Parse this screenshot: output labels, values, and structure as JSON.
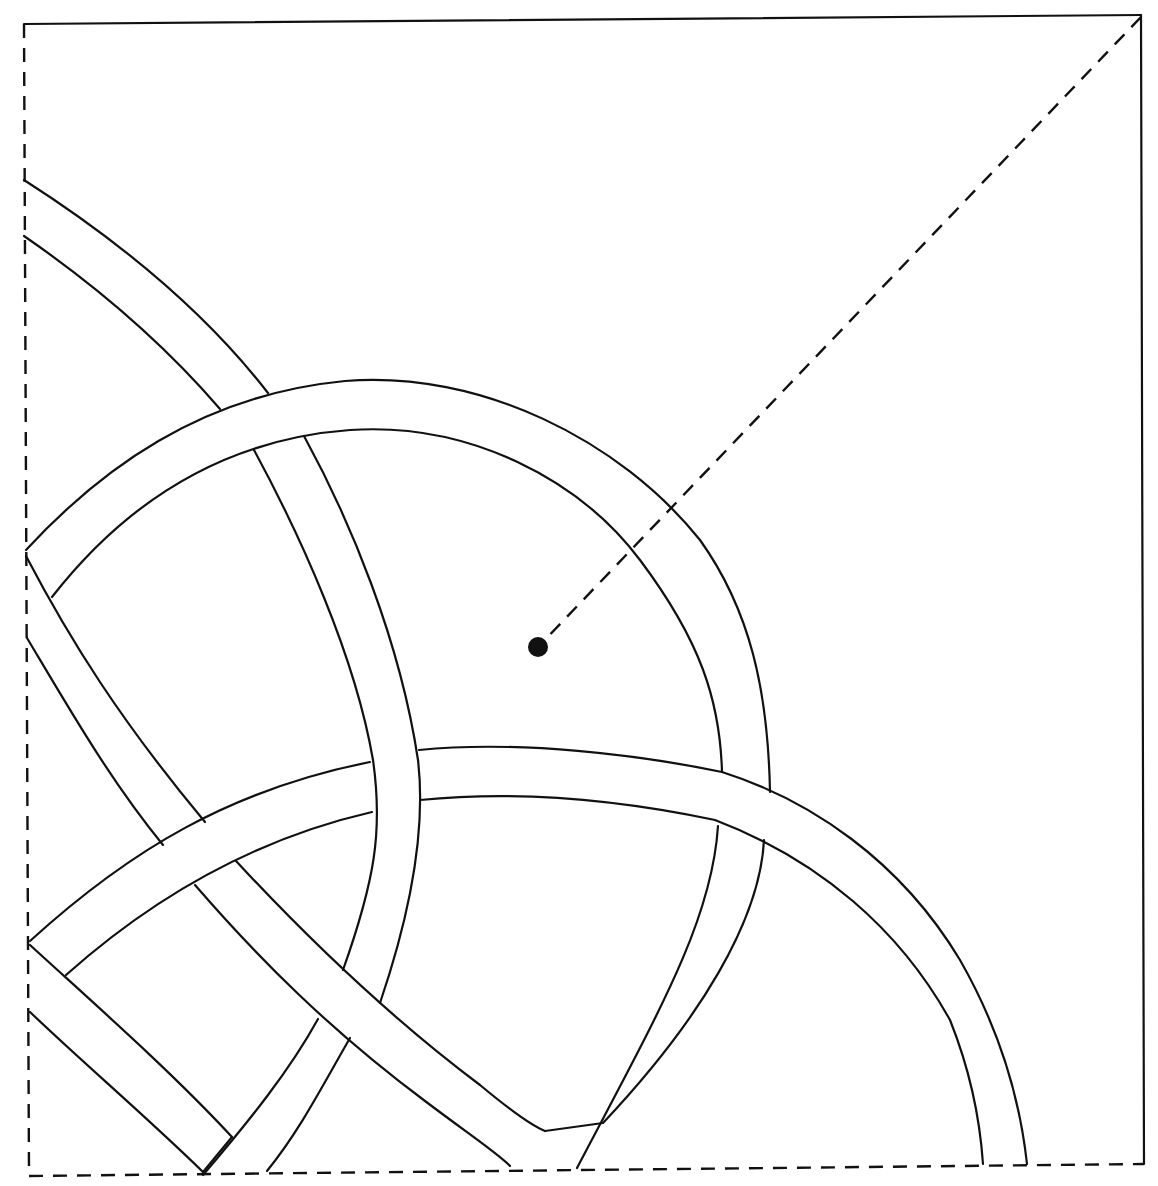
{
  "diagram": {
    "type": "quilt-block-pattern",
    "stroke_color": "#111111",
    "background_color": "#ffffff",
    "border": {
      "top": {
        "style": "solid",
        "d": "M24 24 L1141 15"
      },
      "right": {
        "style": "solid",
        "d": "M1141 15 L1144 1164"
      },
      "left": {
        "style": "dashed",
        "d": "M24 24 L29 1176"
      },
      "bottom": {
        "style": "dashed",
        "d": "M29 1176 L1144 1164"
      }
    },
    "diagonal": {
      "style": "dashed",
      "d": "M1141 17 L540 645"
    },
    "center_dot": {
      "cx": 538,
      "cy": 647,
      "r": 10
    },
    "bands": [
      {
        "name": "top-left-diagonal-band",
        "edges": [
          "M24 180 C110 235, 200 305, 268 393",
          "M24 236 C95 285, 165 345, 220 409",
          "M254 450 C300 535, 355 655, 373 760 C383 830, 375 880, 343 970",
          "M304 436 C350 520, 400 640, 418 760 C425 820, 415 900, 380 1003",
          "M318 1019 C290 1070, 250 1120, 203 1175",
          "M350 1038 C320 1090, 300 1130, 267 1171"
        ]
      },
      {
        "name": "upper-circle-band",
        "edges": [
          "M26 550 C100 470, 200 395, 345 381 C480 370, 620 440, 700 540 C750 610, 768 690, 770 792",
          "M52 597 C120 510, 215 440, 350 430 C470 422, 580 480, 640 560 C700 640, 720 700, 722 772",
          "M718 826 C712 920, 660 1010, 577 1168",
          "M764 840 C760 920, 700 1020, 603 1123 L545 1131"
        ]
      },
      {
        "name": "left-descending-band",
        "edges": [
          "M26 556 C70 640, 120 720, 205 822",
          "M27 638 C70 710, 110 780, 163 845",
          "M195 885 C260 960, 330 1030, 425 1101 C470 1135, 500 1155, 510 1166",
          "M236 861 C300 930, 380 1010, 480 1085 C510 1110, 530 1125, 545 1131"
        ]
      },
      {
        "name": "lower-arc-band",
        "edges": [
          "M30 941 C130 850, 230 790, 370 762",
          "M66 975 C150 900, 250 840, 372 812",
          "M419 750 C520 740, 640 755, 722 772 C810 800, 900 860, 960 960 C1000 1030, 1020 1100, 1027 1164",
          "M420 800 C520 790, 620 800, 715 820 C820 860, 900 930, 950 1020 C970 1070, 980 1120, 983 1164"
        ]
      },
      {
        "name": "bottom-left-band",
        "edges": [
          "M30 945 C90 1000, 170 1070, 232 1137",
          "M30 1012 C80 1060, 150 1120, 203 1172",
          "M203 1172 L232 1137"
        ]
      }
    ]
  }
}
